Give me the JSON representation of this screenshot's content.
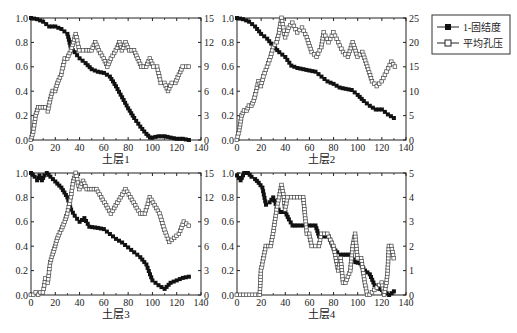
{
  "legend": {
    "items": [
      {
        "label": "1-固结度",
        "marker": "filled-square"
      },
      {
        "label": "平均孔压",
        "marker": "open-square"
      }
    ]
  },
  "chart_data": [
    {
      "type": "line",
      "title": "",
      "xlabel": "土层1",
      "ylabel": "",
      "xlim": [
        0,
        140
      ],
      "xticks": [
        0,
        20,
        40,
        60,
        80,
        100,
        120,
        140
      ],
      "ylim_left": [
        0,
        1.0
      ],
      "yticks_left": [
        "0.0",
        "0.2",
        "0.4",
        "0.6",
        "0.8",
        "1.0"
      ],
      "ylim_right": [
        0,
        15
      ],
      "yticks_right": [
        "0",
        "3",
        "6",
        "9",
        "12",
        "15"
      ],
      "grid": false,
      "series": [
        {
          "name": "1-固结度",
          "axis": "left",
          "marker": "filled-square",
          "x": [
            0,
            5,
            10,
            15,
            20,
            25,
            30,
            33,
            36,
            40,
            45,
            50,
            55,
            60,
            65,
            70,
            75,
            80,
            85,
            90,
            95,
            98,
            100,
            105,
            110,
            115,
            120,
            125,
            130
          ],
          "y": [
            1.0,
            0.99,
            0.97,
            0.93,
            0.93,
            0.91,
            0.87,
            0.75,
            0.72,
            0.67,
            0.63,
            0.58,
            0.56,
            0.55,
            0.52,
            0.44,
            0.35,
            0.26,
            0.18,
            0.11,
            0.05,
            0.02,
            0.02,
            0.03,
            0.03,
            0.02,
            0.01,
            0.01,
            0.0
          ]
        },
        {
          "name": "平均孔压",
          "axis": "right",
          "marker": "open-square",
          "x": [
            0,
            2,
            4,
            6,
            8,
            10,
            12,
            14,
            16,
            18,
            20,
            22,
            25,
            28,
            30,
            33,
            35,
            37,
            40,
            43,
            46,
            50,
            53,
            56,
            60,
            63,
            66,
            70,
            73,
            75,
            78,
            81,
            85,
            88,
            91,
            95,
            98,
            101,
            104,
            107,
            110,
            113,
            116,
            119,
            122,
            125,
            128,
            130
          ],
          "y": [
            0,
            1,
            3,
            4,
            4,
            4,
            4,
            3.5,
            5,
            6,
            6,
            7,
            8,
            10,
            10,
            11,
            12,
            13,
            11,
            11,
            11,
            11,
            12,
            11,
            10,
            9,
            10,
            11,
            12,
            11,
            12,
            11,
            11,
            10,
            9,
            9,
            10,
            9,
            9,
            7,
            7,
            6,
            7,
            7,
            8,
            9,
            9,
            9
          ]
        }
      ]
    },
    {
      "type": "line",
      "title": "",
      "xlabel": "土层2",
      "ylabel": "",
      "xlim": [
        0,
        140
      ],
      "xticks": [
        0,
        20,
        40,
        60,
        80,
        100,
        120,
        140
      ],
      "ylim_left": [
        0,
        1.0
      ],
      "yticks_left": [
        "0.0",
        "0.2",
        "0.4",
        "0.6",
        "0.8",
        "1.0"
      ],
      "ylim_right": [
        0,
        25
      ],
      "yticks_right": [
        "0",
        "5",
        "10",
        "15",
        "20",
        "25"
      ],
      "grid": false,
      "series": [
        {
          "name": "1-固结度",
          "axis": "left",
          "marker": "filled-square",
          "x": [
            0,
            5,
            10,
            15,
            20,
            25,
            30,
            35,
            40,
            45,
            50,
            55,
            60,
            65,
            70,
            75,
            80,
            85,
            90,
            95,
            100,
            105,
            110,
            115,
            120,
            125,
            130
          ],
          "y": [
            1.0,
            0.99,
            0.97,
            0.93,
            0.87,
            0.83,
            0.77,
            0.72,
            0.68,
            0.61,
            0.59,
            0.58,
            0.57,
            0.56,
            0.52,
            0.48,
            0.46,
            0.43,
            0.42,
            0.41,
            0.37,
            0.32,
            0.28,
            0.25,
            0.25,
            0.21,
            0.18
          ]
        },
        {
          "name": "平均孔压",
          "axis": "right",
          "marker": "open-square",
          "x": [
            0,
            2,
            4,
            6,
            8,
            10,
            12,
            14,
            16,
            18,
            20,
            22,
            25,
            28,
            30,
            33,
            35,
            37,
            40,
            43,
            46,
            50,
            54,
            58,
            62,
            66,
            70,
            72,
            76,
            80,
            84,
            88,
            92,
            96,
            100,
            104,
            108,
            112,
            116,
            120,
            124,
            128,
            131
          ],
          "y": [
            0,
            2,
            5,
            6,
            6,
            7,
            7,
            8,
            10,
            12,
            11,
            13,
            15,
            17,
            19,
            20,
            22,
            25,
            21,
            23,
            24,
            22,
            23,
            21,
            18,
            17,
            19,
            22,
            20,
            22,
            20,
            18,
            17,
            20,
            17,
            18,
            15,
            12,
            11,
            12,
            14,
            16,
            15
          ]
        }
      ]
    },
    {
      "type": "line",
      "title": "",
      "xlabel": "土层3",
      "ylabel": "",
      "xlim": [
        0,
        140
      ],
      "xticks": [
        0,
        20,
        40,
        60,
        80,
        100,
        120,
        140
      ],
      "ylim_left": [
        0,
        1.0
      ],
      "yticks_left": [
        "0.0",
        "0.2",
        "0.4",
        "0.6",
        "0.8",
        "1.0"
      ],
      "ylim_right": [
        0,
        15
      ],
      "yticks_right": [
        "0",
        "3",
        "6",
        "9",
        "12",
        "15"
      ],
      "grid": false,
      "series": [
        {
          "name": "1-固结度",
          "axis": "left",
          "marker": "filled-square",
          "x": [
            0,
            3,
            5,
            7,
            9,
            11,
            13,
            16,
            20,
            25,
            30,
            33,
            36,
            40,
            44,
            48,
            55,
            60,
            65,
            70,
            75,
            80,
            85,
            90,
            95,
            98,
            100,
            105,
            110,
            115,
            120,
            125,
            130
          ],
          "y": [
            1.0,
            0.97,
            0.94,
            0.98,
            0.94,
            0.98,
            1.0,
            0.97,
            0.93,
            0.88,
            0.8,
            0.7,
            0.65,
            0.6,
            0.63,
            0.56,
            0.55,
            0.54,
            0.5,
            0.46,
            0.43,
            0.39,
            0.35,
            0.31,
            0.25,
            0.17,
            0.12,
            0.08,
            0.05,
            0.1,
            0.12,
            0.14,
            0.15
          ]
        },
        {
          "name": "平均孔压",
          "axis": "right",
          "marker": "open-square",
          "x": [
            0,
            2,
            4,
            6,
            8,
            10,
            12,
            14,
            16,
            18,
            20,
            22,
            25,
            28,
            30,
            33,
            35,
            37,
            40,
            43,
            46,
            50,
            54,
            58,
            62,
            66,
            70,
            74,
            78,
            82,
            86,
            90,
            94,
            98,
            102,
            106,
            110,
            114,
            118,
            122,
            126,
            130
          ],
          "y": [
            0,
            0,
            0.3,
            0,
            0.3,
            0.3,
            2,
            1.5,
            4,
            5,
            6,
            7,
            8,
            9,
            10,
            12,
            14,
            15,
            13,
            14,
            13,
            13,
            13,
            12,
            11,
            10,
            11,
            12,
            13,
            12,
            11,
            10,
            10,
            12,
            11,
            10,
            8,
            6.5,
            7,
            7.5,
            9,
            8.5
          ]
        }
      ]
    },
    {
      "type": "line",
      "title": "",
      "xlabel": "土层4",
      "ylabel": "",
      "xlim": [
        0,
        140
      ],
      "xticks": [
        0,
        20,
        40,
        60,
        80,
        100,
        120,
        140
      ],
      "ylim_left": [
        0,
        1.0
      ],
      "yticks_left": [
        "0.0",
        "0.2",
        "0.4",
        "0.6",
        "0.8",
        "1.0"
      ],
      "ylim_right": [
        0,
        5
      ],
      "yticks_right": [
        "0",
        "1",
        "2",
        "3",
        "4",
        "5"
      ],
      "grid": false,
      "series": [
        {
          "name": "1-固结度",
          "axis": "left",
          "marker": "filled-square",
          "x": [
            0,
            3,
            6,
            9,
            12,
            15,
            18,
            21,
            24,
            27,
            30,
            33,
            36,
            40,
            43,
            46,
            50,
            55,
            60,
            65,
            68,
            72,
            76,
            80,
            83,
            86,
            90,
            94,
            98,
            102,
            106,
            110,
            114,
            118,
            122,
            126,
            130
          ],
          "y": [
            0.98,
            0.94,
            1.0,
            1.0,
            0.97,
            0.95,
            0.92,
            0.88,
            0.74,
            0.76,
            0.8,
            0.72,
            0.68,
            0.68,
            0.62,
            0.57,
            0.57,
            0.57,
            0.57,
            0.57,
            0.48,
            0.48,
            0.48,
            0.38,
            0.35,
            0.33,
            0.33,
            0.33,
            0.27,
            0.26,
            0.2,
            0.17,
            0.08,
            0.05,
            0.03,
            0.0,
            0.03
          ]
        },
        {
          "name": "平均孔压",
          "axis": "right",
          "marker": "open-square",
          "x": [
            0,
            3,
            18,
            19,
            20,
            22,
            24,
            28,
            30,
            33,
            35,
            37,
            39,
            40,
            42,
            45,
            50,
            55,
            56,
            58,
            60,
            62,
            65,
            68,
            70,
            75,
            80,
            82,
            84,
            86,
            88,
            90,
            94,
            96,
            98,
            100,
            103,
            106,
            108,
            110,
            120,
            122,
            124,
            125,
            126,
            128,
            130
          ],
          "y": [
            0,
            0,
            0,
            0,
            1,
            1.5,
            2,
            2,
            2.5,
            3.5,
            4,
            4.5,
            4,
            3.5,
            4,
            4,
            4,
            4,
            3.5,
            2.5,
            2.5,
            2,
            2,
            2,
            2.5,
            2.5,
            2,
            1.5,
            1,
            1.5,
            0.5,
            0.5,
            1,
            2,
            2.5,
            1.5,
            1.5,
            0.5,
            0,
            0,
            0.5,
            0,
            0.5,
            1,
            2,
            2,
            1.5
          ]
        }
      ]
    }
  ],
  "plots": [
    {
      "id": "p1",
      "xlabel": "土层1"
    },
    {
      "id": "p2",
      "xlabel": "土层2"
    },
    {
      "id": "p3",
      "xlabel": "土层3"
    },
    {
      "id": "p4",
      "xlabel": "土层4"
    }
  ]
}
